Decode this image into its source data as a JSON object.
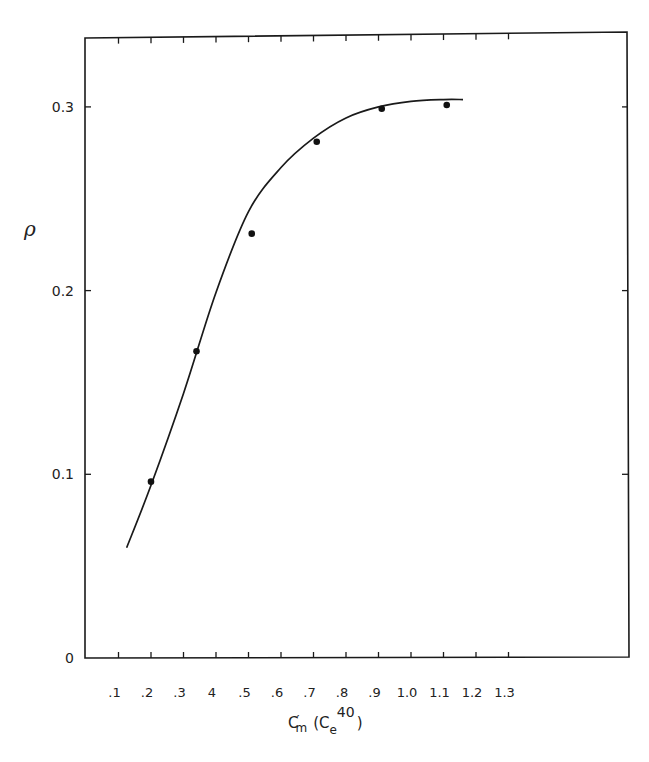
{
  "chart_data": {
    "type": "scatter",
    "title": "",
    "xlabel": "C′m (Ce40)",
    "xlabel_parts": {
      "main": "C",
      "prime": "′",
      "sub_m": "m",
      "paren_open": "(C",
      "sub_e": "e",
      "sup": "40",
      "paren_close": ")"
    },
    "ylabel": "ρ",
    "x_ticks": [
      ".1",
      ".2",
      ".3",
      "4",
      ".5",
      ".6",
      ".7",
      ".8",
      ".9",
      "1.0",
      "1.1",
      "1.2",
      "1.3"
    ],
    "x_tick_values": [
      0.1,
      0.2,
      0.3,
      0.4,
      0.5,
      0.6,
      0.7,
      0.8,
      0.9,
      1.0,
      1.1,
      1.2,
      1.3
    ],
    "y_ticks": [
      "0",
      "0.1",
      "0.2",
      "0.3"
    ],
    "y_tick_values": [
      0,
      0.1,
      0.2,
      0.3
    ],
    "xlim": [
      0.0,
      1.45
    ],
    "ylim": [
      0,
      0.34
    ],
    "grid": false,
    "legend": null,
    "series": [
      {
        "name": "measured",
        "type": "scatter",
        "marker": "filled-circle",
        "x": [
          0.2,
          0.34,
          0.51,
          0.71,
          0.91,
          1.11
        ],
        "y": [
          0.096,
          0.167,
          0.231,
          0.281,
          0.299,
          0.301
        ]
      },
      {
        "name": "fitted curve",
        "type": "line",
        "x": [
          0.125,
          0.2,
          0.3,
          0.4,
          0.5,
          0.6,
          0.7,
          0.8,
          0.9,
          1.0,
          1.1,
          1.16
        ],
        "y": [
          0.06,
          0.094,
          0.144,
          0.199,
          0.243,
          0.267,
          0.283,
          0.294,
          0.3,
          0.303,
          0.304,
          0.304
        ]
      }
    ]
  }
}
